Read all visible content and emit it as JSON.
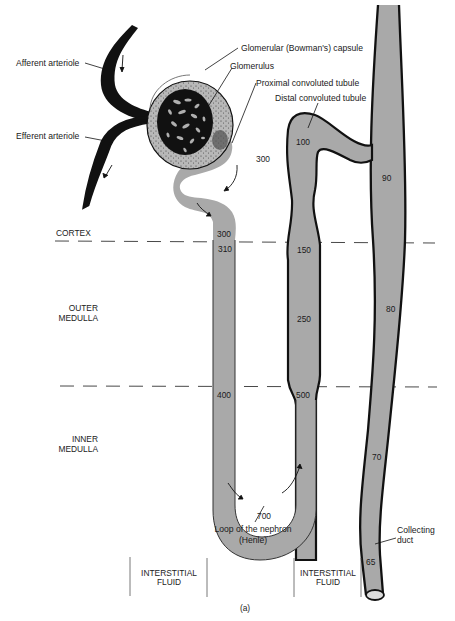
{
  "figure": {
    "caption": "(a)",
    "colors": {
      "tubule_fill": "#a9a9a9",
      "outline": "#111111",
      "capsule_fill": "#b4b4b4",
      "glomerulus": "#111111",
      "background": "#ffffff"
    }
  },
  "labels": {
    "afferent": "Afferent arteriole",
    "efferent": "Efferent arteriole",
    "capsule": "Glomerular (Bowman's) capsule",
    "glomerulus": "Glomerulus",
    "proximal": "Proximal convoluted tubule",
    "distal": "Distal convoluted tubule",
    "loop_line1": "Loop of the nephron",
    "loop_line2": "(Henle)",
    "duct_line1": "Collecting",
    "duct_line2": "duct"
  },
  "zones": {
    "cortex": "CORTEX",
    "outer_line1": "OUTER",
    "outer_line2": "MEDULLA",
    "inner_line1": "INNER",
    "inner_line2": "MEDULLA"
  },
  "interstitial": [
    {
      "line1": "INTERSTITIAL",
      "line2": "FLUID"
    },
    {
      "line1": "INTERSTITIAL",
      "line2": "FLUID"
    }
  ],
  "osmolarity": {
    "proximal_top": "300",
    "proximal_cortex": "300",
    "descending_top": "310",
    "descending_inner": "400",
    "loop_bottom": "700",
    "ascending_inner": "500",
    "ascending_outer": "250",
    "ascending_top": "150",
    "distal": "100",
    "duct_cortex": "90",
    "duct_outer": "80",
    "duct_inner": "70",
    "duct_bottom": "65"
  }
}
